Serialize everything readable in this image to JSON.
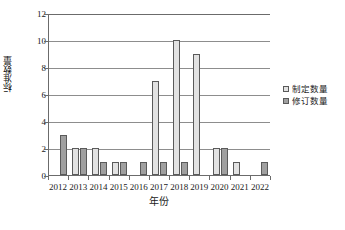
{
  "chart_data": {
    "type": "bar",
    "title": "",
    "xlabel": "年份",
    "ylabel": "标准数量",
    "categories": [
      "2012",
      "2013",
      "2014",
      "2015",
      "2016",
      "2017",
      "2018",
      "2019",
      "2020",
      "2021",
      "2022"
    ],
    "series": [
      {
        "name": "制定数量",
        "color": "#e2e2e2",
        "values": [
          0,
          2,
          2,
          1,
          0,
          7,
          10,
          9,
          2,
          1,
          0
        ]
      },
      {
        "name": "修订数量",
        "color": "#a0a0a0",
        "values": [
          3,
          2,
          1,
          1,
          1,
          1,
          1,
          0,
          2,
          0,
          1
        ]
      }
    ],
    "ylim": [
      0,
      12
    ],
    "yticks": [
      0,
      2,
      4,
      6,
      8,
      10,
      12
    ],
    "grid": true,
    "legend_position": "right"
  },
  "legend": {
    "items": [
      {
        "label": "制定数量"
      },
      {
        "label": "修订数量"
      }
    ]
  },
  "axes": {
    "y_title": "标准数量",
    "x_title": "年份"
  }
}
